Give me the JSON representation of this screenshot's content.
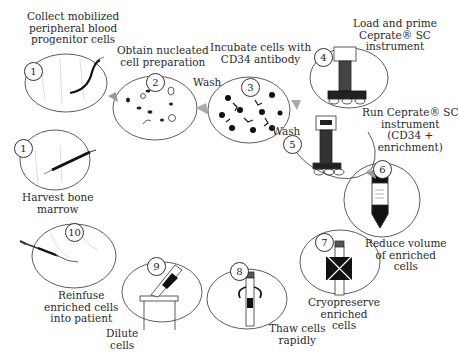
{
  "diagram": {
    "type": "process-cycle",
    "steps": [
      {
        "number": "1",
        "label_lines": [
          "Collect mobilized",
          "peripheral blood",
          "progenitor cells"
        ],
        "icon": "blood-vessel-catheter-icon"
      },
      {
        "number": "1",
        "label_lines": [
          "Harvest bone",
          "marrow"
        ],
        "icon": "syringe-icon"
      },
      {
        "number": "2",
        "label_lines": [
          "Obtain nucleated",
          "cell preparation"
        ],
        "icon": "cells-dish-icon"
      },
      {
        "number": "3",
        "label_lines": [
          "Incubate cells with",
          "CD34 antibody"
        ],
        "icon": "antibody-cells-icon"
      },
      {
        "number": "4",
        "label_lines": [
          "Load and prime",
          "Ceprate® SC",
          "instrument"
        ],
        "icon": "ceprate-instrument-icon"
      },
      {
        "number": "5",
        "label_lines": [
          "Run Ceprate® SC",
          "instrument",
          "(CD34 +",
          "enrichment)"
        ],
        "icon": "ceprate-instrument-running-icon"
      },
      {
        "number": "6",
        "label_lines": [
          "Reduce volume",
          "of enriched",
          "cells"
        ],
        "icon": "centrifuge-tube-icon"
      },
      {
        "number": "7",
        "label_lines": [
          "Cryopreserve",
          "enriched",
          "cells"
        ],
        "icon": "frozen-vial-icon"
      },
      {
        "number": "8",
        "label_lines": [
          "Thaw cells",
          "rapidly"
        ],
        "icon": "thaw-vial-icon"
      },
      {
        "number": "9",
        "label_lines": [
          "Dilute",
          "cells"
        ],
        "icon": "pipette-dilution-icon"
      },
      {
        "number": "10",
        "label_lines": [
          "Reinfuse",
          "enriched  cells",
          "into patient"
        ],
        "icon": "infusion-syringe-icon"
      }
    ],
    "connectors": [
      {
        "between": [
          "2",
          "3"
        ],
        "label": "Wash"
      },
      {
        "between": [
          "3",
          "5"
        ],
        "label": "Wash"
      }
    ]
  }
}
